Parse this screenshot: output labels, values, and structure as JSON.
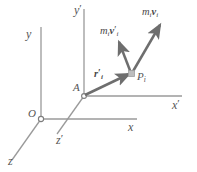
{
  "figure": {
    "background_color": "#ffffff",
    "axis_color": "#8a8a8a",
    "vector_color": "#6e6e6e",
    "label_color": "#555555",
    "point_marker_color": "#b5b5b5"
  },
  "axes": {
    "fixed_frame": {
      "origin_label": "O",
      "x_label": "x",
      "y_label": "y",
      "z_label": "z"
    },
    "moving_frame": {
      "origin_label": "A",
      "x_label_base": "x",
      "x_label_prime": "′",
      "y_label_base": "y",
      "y_label_prime": "′",
      "z_label_base": "z",
      "z_label_prime": "′"
    }
  },
  "points": {
    "particle": {
      "base": "P",
      "sub": "i"
    }
  },
  "vectors": [
    {
      "id": "position-vector",
      "base": "r",
      "prime": "′",
      "sub": "i",
      "bold": true,
      "from": "A",
      "to": "P_i"
    },
    {
      "id": "relative-momentum-vector",
      "mass_base": "m",
      "mass_sub": "i",
      "vel_base": "v",
      "vel_prime": "′",
      "vel_sub": "i",
      "bold_velocity": true,
      "from": "P_i"
    },
    {
      "id": "absolute-momentum-vector",
      "mass_base": "m",
      "mass_sub": "i",
      "vel_base": "v",
      "vel_prime": "",
      "vel_sub": "i",
      "bold_velocity": true,
      "from": "P_i"
    }
  ],
  "labels": {
    "origin_O": "O",
    "origin_A": "A",
    "x": "x",
    "y": "y",
    "z": "z",
    "x_prime": "x′",
    "y_prime": "y′",
    "z_prime": "z′",
    "P_base": "P",
    "P_sub": "i",
    "r_base": "r",
    "r_prime": "′",
    "r_sub": "i",
    "mv_prime_m": "m",
    "mv_prime_msub": "i",
    "mv_prime_v": "v",
    "mv_prime_vprime": "′",
    "mv_prime_vsub": "i",
    "mv_m": "m",
    "mv_msub": "i",
    "mv_v": "v",
    "mv_vsub": "i"
  }
}
